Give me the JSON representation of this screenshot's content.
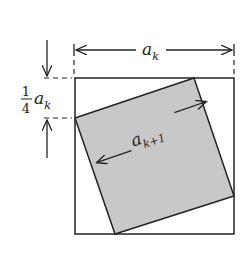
{
  "figure": {
    "type": "geometric-construction",
    "colors": {
      "stroke": "#222222",
      "inner_fill": "#c8c8c8",
      "background": "#ffffff"
    }
  },
  "labels": {
    "outer_side": {
      "base": "a",
      "sub": "k"
    },
    "inner_side": {
      "base": "a",
      "sub": "k+1"
    },
    "offset": {
      "numerator": "1",
      "denominator": "4",
      "base": "a",
      "sub": "k"
    }
  },
  "geometry": {
    "outer_square": {
      "x": 75,
      "y": 78,
      "size": 159
    },
    "inner_square_points": [
      [
        194,
        78
      ],
      [
        234,
        196
      ],
      [
        115,
        234
      ],
      [
        75,
        118
      ]
    ]
  }
}
